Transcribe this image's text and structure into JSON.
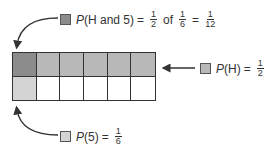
{
  "colors": {
    "both": "#8c8c8c",
    "heads": "#b8b8b8",
    "five": "#d4d4d4",
    "empty": "#ffffff",
    "line": "#333333"
  },
  "grid": {
    "rows": 2,
    "cols": 6,
    "cells": [
      [
        "both",
        "heads",
        "heads",
        "heads",
        "heads",
        "heads"
      ],
      [
        "five",
        "empty",
        "empty",
        "empty",
        "empty",
        "empty"
      ]
    ]
  },
  "labels": {
    "joint": {
      "p": "P",
      "event": "(H and 5)",
      "eq1": "=",
      "f1_num": "1",
      "f1_den": "2",
      "of": "of",
      "f2_num": "1",
      "f2_den": "6",
      "eq2": "=",
      "f3_num": "1",
      "f3_den": "12"
    },
    "heads": {
      "p": "P",
      "event": "(H)",
      "eq": "=",
      "f_num": "1",
      "f_den": "2"
    },
    "five": {
      "p": "P",
      "event": "(5)",
      "eq": "=",
      "f_num": "1",
      "f_den": "6"
    }
  }
}
